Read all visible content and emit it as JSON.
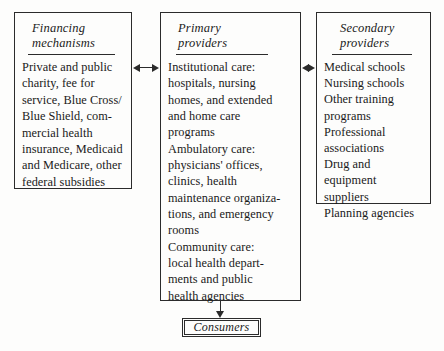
{
  "diagram": {
    "type": "flow-diagram",
    "ink_color": "#2b2b2b",
    "background_color": "#fdfdfc",
    "boxes": [
      {
        "id": "financing",
        "heading": "Financing\nmechanisms",
        "body": "Private and public\ncharity, fee for\nservice, Blue Cross/\nBlue Shield, com-\nmercial health\ninsurance, Medicaid\nand Medicare, other\nfederal subsidies"
      },
      {
        "id": "primary",
        "heading": "Primary\nproviders",
        "body": "Institutional care:\n hospitals, nursing\n homes, and extended\n and home care\n programs\nAmbulatory care:\n physicians' offices,\n clinics, health\n maintenance organiza-\n tions, and emergency\n rooms\nCommunity care:\n local health depart-\n ments and public\n health agencies"
      },
      {
        "id": "secondary",
        "heading": "Secondary\nproviders",
        "body": "Medical schools\nNursing schools\nOther training\n programs\nProfessional\n associations\nDrug and equipment\n suppliers\nPlanning agencies"
      }
    ],
    "consumers": {
      "label": "Consumers"
    },
    "connectors": [
      {
        "id": "financing-to-primary",
        "kind": "double-headed-arrow",
        "from": "financing",
        "to": "primary"
      },
      {
        "id": "primary-to-secondary",
        "kind": "double-headed-arrow",
        "from": "primary",
        "to": "secondary"
      },
      {
        "id": "primary-to-consumers",
        "kind": "down-arrow",
        "from": "primary",
        "to": "consumers"
      }
    ]
  }
}
